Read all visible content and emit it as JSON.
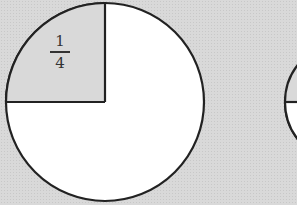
{
  "diagram": {
    "circle1": {
      "shaded_fraction_label_numerator": "1",
      "shaded_fraction_label_denominator": "4",
      "shaded_fraction": 0.25
    },
    "colors": {
      "background": "#d9d9d9",
      "fill": "#ffffff",
      "stroke": "#222222"
    }
  }
}
